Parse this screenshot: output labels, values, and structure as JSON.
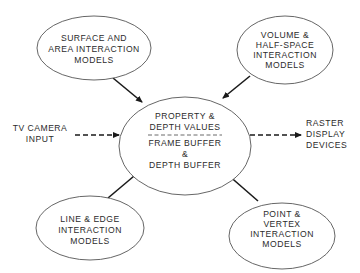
{
  "diagram": {
    "type": "flow-diagram",
    "center_node": {
      "top_lines": [
        "PROPERTY &",
        "DEPTH VALUES"
      ],
      "bottom_lines": [
        "FRAME BUFFER",
        "&",
        "DEPTH BUFFER"
      ]
    },
    "nodes": {
      "surface": {
        "lines": [
          "SURFACE AND",
          "AREA INTERACTION",
          "MODELS"
        ]
      },
      "volume": {
        "lines": [
          "VOLUME &",
          "HALF-SPACE",
          "INTERACTION",
          "MODELS"
        ]
      },
      "line_edge": {
        "lines": [
          "LINE & EDGE",
          "INTERACTION",
          "MODELS"
        ]
      },
      "point_vertex": {
        "lines": [
          "POINT &",
          "VERTEX",
          "INTERACTION",
          "MODELS"
        ]
      }
    },
    "external": {
      "input": {
        "lines": [
          "TV CAMERA",
          "INPUT"
        ]
      },
      "output": {
        "lines": [
          "RASTER",
          "DISPLAY",
          "DEVICES"
        ]
      }
    },
    "edges": [
      {
        "from": "surface",
        "to": "center",
        "style": "solid"
      },
      {
        "from": "volume",
        "to": "center",
        "style": "solid"
      },
      {
        "from": "line_edge",
        "to": "center",
        "style": "solid"
      },
      {
        "from": "point_vertex",
        "to": "center",
        "style": "solid"
      },
      {
        "from": "input",
        "to": "center",
        "style": "dashed"
      },
      {
        "from": "center",
        "to": "output",
        "style": "dashed"
      }
    ],
    "colors": {
      "stroke": "#1a1a1a",
      "text": "#2b2b2b",
      "background": "#ffffff"
    }
  }
}
